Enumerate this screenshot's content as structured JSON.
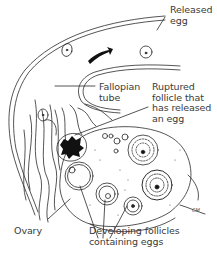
{
  "diagram": {
    "labels": {
      "released_egg": "Released\negg",
      "fallopian_tube": "Fallopian\ntube",
      "ruptured_follicle": "Ruptured\nfollicle that\nhas released\nan egg",
      "ovary": "Ovary",
      "developing_follicles": "Developing follicles\ncontaining eggs"
    },
    "signature": "CM",
    "colors": {
      "line": "#2a2a2a",
      "text": "#3a3a3a",
      "ruptured_fill": "#111111",
      "background": "#ffffff"
    }
  }
}
